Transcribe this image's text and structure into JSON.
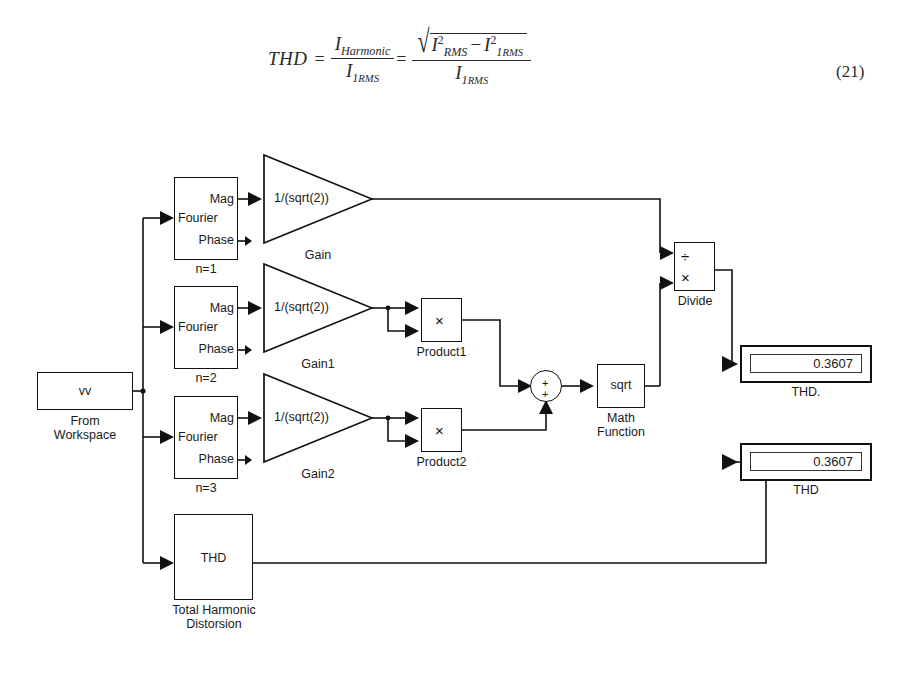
{
  "equation": {
    "lhs": "THD",
    "equals": "=",
    "frac1_num_var": "I",
    "frac1_num_sub": "Harmonic",
    "frac1_den_var": "I",
    "frac1_den_sub": "1",
    "frac1_den_subsub": "RMS",
    "frac2_num_var1": "I",
    "frac2_num_var1_sup": "2",
    "frac2_num_var1_sub": "RMS",
    "frac2_num_minus": "−",
    "frac2_num_var2": "I",
    "frac2_num_var2_sup": "2",
    "frac2_num_var2_sub": "1",
    "frac2_num_var2_subsub": "RMS",
    "frac2_den_var": "I",
    "frac2_den_sub": "1",
    "frac2_den_subsub": "RMS",
    "radical_sign": "√",
    "number": "(21)"
  },
  "diagram": {
    "from_workspace": {
      "value": "vv",
      "label_line1": "From",
      "label_line2": "Workspace"
    },
    "fourier_blocks": [
      {
        "port_out_top": "Mag",
        "name": "Fourier",
        "port_out_bottom": "Phase",
        "label": "n=1"
      },
      {
        "port_out_top": "Mag",
        "name": "Fourier",
        "port_out_bottom": "Phase",
        "label": "n=2"
      },
      {
        "port_out_top": "Mag",
        "name": "Fourier",
        "port_out_bottom": "Phase",
        "label": "n=3"
      }
    ],
    "gain_blocks": [
      {
        "expression": "1/(sqrt(2))",
        "label": "Gain"
      },
      {
        "expression": "1/(sqrt(2))",
        "label": "Gain1"
      },
      {
        "expression": "1/(sqrt(2))",
        "label": "Gain2"
      }
    ],
    "product_blocks": [
      {
        "symbol": "×",
        "label": "Product1"
      },
      {
        "symbol": "×",
        "label": "Product2"
      }
    ],
    "sum_block": {
      "sign_top": "+",
      "sign_bottom": "+"
    },
    "math_function": {
      "symbol": "sqrt",
      "label_line1": "Math",
      "label_line2": "Function"
    },
    "divide_block": {
      "symbol_top": "÷",
      "symbol_bottom": "×",
      "label": "Divide"
    },
    "thd_block": {
      "symbol": "THD",
      "label_line1": "Total Harmonic",
      "label_line2": "Distorsion"
    },
    "displays": [
      {
        "value": "0.3607",
        "label": "THD."
      },
      {
        "value": "0.3607",
        "label": "THD"
      }
    ]
  },
  "colors": {
    "line": "#111111",
    "text": "#1a1a1a",
    "background": "#ffffff"
  }
}
